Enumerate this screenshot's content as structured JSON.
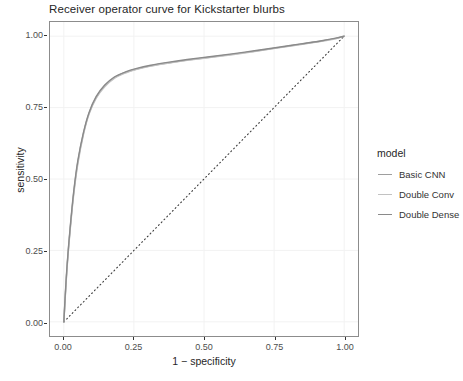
{
  "chart_data": {
    "type": "line",
    "title": "Receiver operator curve for Kickstarter blurbs",
    "xlabel": "1 − specificity",
    "ylabel": "sensitivity",
    "xlim": [
      0,
      1
    ],
    "ylim": [
      0,
      1
    ],
    "grid": true,
    "xticks": [
      "0.00",
      "0.25",
      "0.50",
      "0.75",
      "1.00"
    ],
    "xtick_values": [
      0,
      0.25,
      0.5,
      0.75,
      1
    ],
    "yticks": [
      "0.00",
      "0.25",
      "0.50",
      "0.75",
      "1.00"
    ],
    "ytick_values": [
      0,
      0.25,
      0.5,
      0.75,
      1
    ],
    "legend": {
      "title": "model",
      "position": "right",
      "entries": [
        {
          "label": "Basic CNN",
          "color": "#9e9e9e"
        },
        {
          "label": "Double Conv",
          "color": "#c2c2c2"
        },
        {
          "label": "Double Dense",
          "color": "#8a8a8a"
        }
      ]
    },
    "reference_line": {
      "name": "chance-diagonal",
      "style": "dotted",
      "color": "#3d3d3d",
      "x": [
        0,
        1
      ],
      "y": [
        0,
        1
      ]
    },
    "series": [
      {
        "name": "Basic CNN",
        "color": "#9e9e9e",
        "x": [
          0,
          0.005,
          0.012,
          0.022,
          0.035,
          0.05,
          0.07,
          0.09,
          0.115,
          0.145,
          0.18,
          0.22,
          0.26,
          0.31,
          0.37,
          0.44,
          0.52,
          0.6,
          0.68,
          0.76,
          0.84,
          0.92,
          0.97,
          1
        ],
        "y": [
          0,
          0.09,
          0.2,
          0.32,
          0.45,
          0.56,
          0.66,
          0.73,
          0.785,
          0.825,
          0.855,
          0.873,
          0.885,
          0.896,
          0.906,
          0.916,
          0.926,
          0.936,
          0.947,
          0.959,
          0.971,
          0.983,
          0.992,
          1
        ]
      },
      {
        "name": "Double Conv",
        "color": "#c2c2c2",
        "x": [
          0,
          0.005,
          0.012,
          0.022,
          0.035,
          0.05,
          0.07,
          0.09,
          0.115,
          0.145,
          0.18,
          0.22,
          0.26,
          0.31,
          0.37,
          0.44,
          0.52,
          0.6,
          0.68,
          0.76,
          0.84,
          0.92,
          0.97,
          1
        ],
        "y": [
          0,
          0.085,
          0.195,
          0.315,
          0.443,
          0.553,
          0.655,
          0.727,
          0.782,
          0.822,
          0.852,
          0.871,
          0.884,
          0.895,
          0.905,
          0.915,
          0.925,
          0.935,
          0.946,
          0.958,
          0.97,
          0.982,
          0.991,
          1
        ]
      },
      {
        "name": "Double Dense",
        "color": "#8a8a8a",
        "x": [
          0,
          0.005,
          0.012,
          0.022,
          0.035,
          0.05,
          0.07,
          0.09,
          0.115,
          0.145,
          0.18,
          0.22,
          0.26,
          0.31,
          0.37,
          0.44,
          0.52,
          0.6,
          0.68,
          0.76,
          0.84,
          0.92,
          0.97,
          1
        ],
        "y": [
          0,
          0.095,
          0.205,
          0.325,
          0.455,
          0.565,
          0.663,
          0.733,
          0.788,
          0.828,
          0.857,
          0.875,
          0.887,
          0.898,
          0.908,
          0.918,
          0.928,
          0.938,
          0.949,
          0.96,
          0.972,
          0.984,
          0.993,
          1
        ]
      }
    ]
  },
  "style": {
    "panel_background": "#ffffff",
    "grid_color": "#f2f2f2",
    "panel_border": "#8c8c8c"
  }
}
